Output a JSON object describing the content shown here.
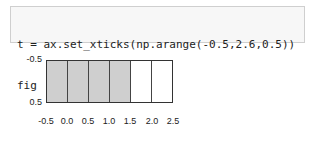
{
  "code_cell": {
    "lines": [
      "t = ax.set_xticks(np.arange(-0.5,2.6,0.5))",
      "fig"
    ]
  },
  "chart_data": {
    "type": "heatmap",
    "title": "",
    "xlabel": "",
    "ylabel": "",
    "x_ticks": [
      "-0.5",
      "0.0",
      "0.5",
      "1.0",
      "1.5",
      "2.0",
      "2.5"
    ],
    "y_ticks": [
      "-0.5",
      "0.5"
    ],
    "xlim": [
      -0.5,
      2.5
    ],
    "ylim": [
      0.5,
      -0.5
    ],
    "cells": [
      {
        "col": 0,
        "filled": true
      },
      {
        "col": 1,
        "filled": true
      },
      {
        "col": 2,
        "filled": true
      },
      {
        "col": 3,
        "filled": true
      },
      {
        "col": 4,
        "filled": false
      },
      {
        "col": 5,
        "filled": false
      }
    ],
    "colors": {
      "filled": "#cfcfcf",
      "empty": "#ffffff",
      "grid": "#444444"
    }
  }
}
